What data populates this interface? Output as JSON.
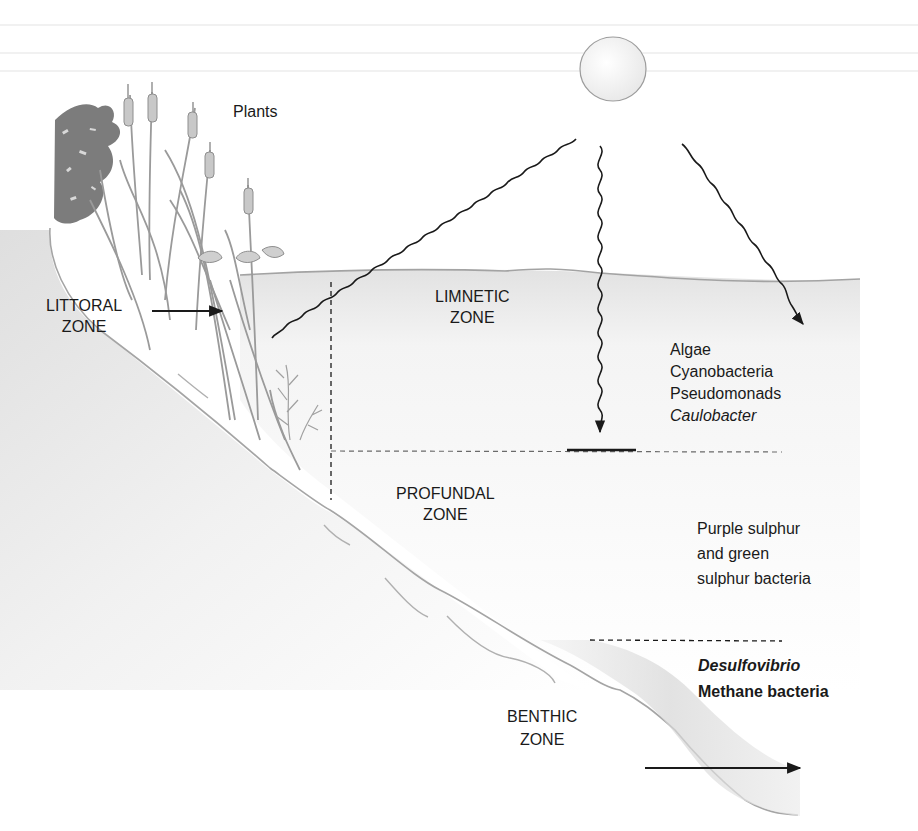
{
  "figure": {
    "colors": {
      "ink": "#1a1a1a",
      "plant_gray": "#9a9a9a",
      "foliage_dark": "#7c7c7c",
      "water_shade": "#ededed",
      "sediment_shade": "#cfcfcf",
      "sun_fill": "#f3f3f3",
      "sun_stroke": "#9c9c9c"
    },
    "labels": {
      "plants": "Plants",
      "littoral_zone": [
        "LITTORAL",
        "ZONE"
      ],
      "limnetic_zone": [
        "LIMNETIC",
        "ZONE"
      ],
      "profundal_zone": [
        "PROFUNDAL",
        "ZONE"
      ],
      "benthic_zone": [
        "BENTHIC",
        "ZONE"
      ]
    },
    "organisms": {
      "limnetic": [
        {
          "name": "Algae",
          "style": "normal"
        },
        {
          "name": "Cyanobacteria",
          "style": "normal"
        },
        {
          "name": "Pseudomonads",
          "style": "normal"
        },
        {
          "name": "Caulobacter",
          "style": "italic"
        }
      ],
      "profundal": [
        {
          "name": "Purple sulphur",
          "style": "normal"
        },
        {
          "name": "and green",
          "style": "normal"
        },
        {
          "name": "sulphur bacteria",
          "style": "normal"
        }
      ],
      "benthic": [
        {
          "name": "Desulfovibrio",
          "style": "bold-italic"
        },
        {
          "name": "Methane bacteria",
          "style": "bold"
        }
      ]
    },
    "elements": {
      "sun_icon": "sun",
      "light_rays": [
        "sunlight-ray-left",
        "sunlight-ray-vertical",
        "sunlight-ray-right"
      ],
      "zone_boundaries": [
        "littoral-limnetic-boundary",
        "photic-depth-boundary",
        "benthic-boundary"
      ]
    }
  }
}
